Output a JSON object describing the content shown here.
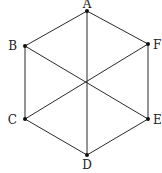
{
  "diagram": {
    "type": "graph",
    "vertices": [
      {
        "id": "A",
        "label": "A",
        "x": 87,
        "y": 11,
        "label_x": 87,
        "label_y": 8,
        "anchor": "middle"
      },
      {
        "id": "B",
        "label": "B",
        "x": 25,
        "y": 46,
        "label_x": 17,
        "label_y": 50,
        "anchor": "end"
      },
      {
        "id": "F",
        "label": "F",
        "x": 148,
        "y": 44,
        "label_x": 153,
        "label_y": 49,
        "anchor": "start"
      },
      {
        "id": "C",
        "label": "C",
        "x": 25,
        "y": 119,
        "label_x": 17,
        "label_y": 124,
        "anchor": "end"
      },
      {
        "id": "E",
        "label": "E",
        "x": 148,
        "y": 119,
        "label_x": 153,
        "label_y": 124,
        "anchor": "start"
      },
      {
        "id": "D",
        "label": "D",
        "x": 87,
        "y": 155,
        "label_x": 87,
        "label_y": 169,
        "anchor": "middle"
      }
    ],
    "edges": [
      {
        "from": "A",
        "to": "B"
      },
      {
        "from": "A",
        "to": "F"
      },
      {
        "from": "B",
        "to": "C"
      },
      {
        "from": "F",
        "to": "E"
      },
      {
        "from": "C",
        "to": "D"
      },
      {
        "from": "E",
        "to": "D"
      },
      {
        "from": "A",
        "to": "D"
      },
      {
        "from": "B",
        "to": "E"
      },
      {
        "from": "F",
        "to": "C"
      }
    ]
  }
}
